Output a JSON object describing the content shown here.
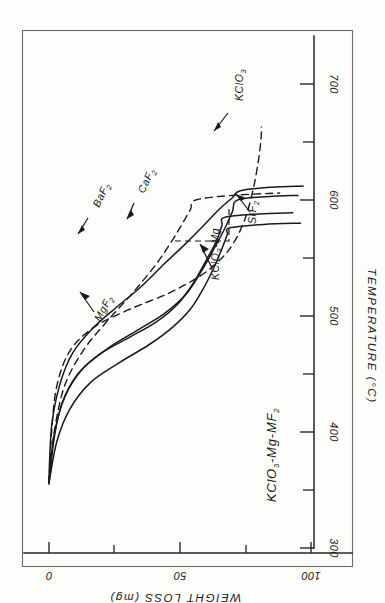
{
  "figure": {
    "title": "KClO3-Mg-MF2",
    "title_parts": {
      "a": "KClO",
      "a_sub": "3",
      "b": "-Mg-MF",
      "b_sub": "2"
    },
    "orientation": "rotated-90",
    "background": "#fdfdfc",
    "ink_color": "#1a1a1a"
  },
  "axes": {
    "temperature": {
      "label": "TEMPERATURE (°C)",
      "unit": "°C",
      "ticks": [
        "300",
        "400",
        "500",
        "600",
        "700"
      ],
      "minor_ticks": [
        "350",
        "450",
        "550",
        "650"
      ],
      "range": [
        270,
        720
      ]
    },
    "weight_loss": {
      "label": "WEIGHT LOSS (mg)",
      "unit": "mg",
      "ticks": [
        "0",
        "50",
        "100"
      ],
      "minor_ticks": [
        "25",
        "75"
      ],
      "range": [
        0,
        108
      ]
    }
  },
  "curve_labels": {
    "kclo3": {
      "a": "KCl",
      "a_sub": "",
      "text": "KClO3"
    },
    "kclo3_mg": {
      "text": "KClO3-Mg"
    },
    "baf2": {
      "text": "BaF2"
    },
    "caf2": {
      "text": "CaF2"
    },
    "srf2": {
      "text": "SrF2"
    },
    "mgf2": {
      "text": "MgF2"
    }
  },
  "chart_data": {
    "type": "line",
    "title": "KClO3-Mg-MF2",
    "xlabel": "TEMPERATURE (°C)",
    "ylabel": "WEIGHT LOSS (mg)",
    "xlim": [
      270,
      720
    ],
    "ylim": [
      0,
      108
    ],
    "xticks": [
      300,
      400,
      500,
      600,
      700
    ],
    "xticks_minor": [
      350,
      450,
      550,
      650
    ],
    "yticks": [
      0,
      50,
      100
    ],
    "yticks_minor": [
      25,
      75
    ],
    "grid": false,
    "legend": "inline-leader-labels",
    "note": "Hand-drawn TGA curves; figure is printed rotated 90 degrees so the temperature axis is vertical at right and the weight-loss axis horizontal at bottom with inverted lettering.",
    "series": [
      {
        "name": "KClO3",
        "style": "dashed",
        "points": [
          [
            355,
            0
          ],
          [
            400,
            1
          ],
          [
            440,
            3
          ],
          [
            470,
            8
          ],
          [
            490,
            17
          ],
          [
            505,
            30
          ],
          [
            520,
            46
          ],
          [
            535,
            58
          ],
          [
            550,
            66
          ],
          [
            565,
            71
          ],
          [
            585,
            75
          ],
          [
            610,
            78
          ],
          [
            635,
            80
          ],
          [
            655,
            81
          ],
          [
            663,
            81
          ]
        ]
      },
      {
        "name": "KClO3-Mg",
        "style": "dashed",
        "points": [
          [
            358,
            0
          ],
          [
            400,
            2
          ],
          [
            440,
            6
          ],
          [
            470,
            13
          ],
          [
            495,
            22
          ],
          [
            520,
            32
          ],
          [
            545,
            41
          ],
          [
            565,
            47
          ],
          [
            580,
            51
          ],
          [
            592,
            54
          ],
          [
            600,
            56
          ],
          [
            604,
            70
          ],
          [
            606,
            88
          ]
        ]
      },
      {
        "name": "BaF2",
        "style": "solid",
        "points": [
          [
            357,
            0
          ],
          [
            395,
            2
          ],
          [
            425,
            5
          ],
          [
            450,
            11
          ],
          [
            468,
            20
          ],
          [
            482,
            31
          ],
          [
            495,
            41
          ],
          [
            510,
            49
          ],
          [
            528,
            55
          ],
          [
            548,
            60
          ],
          [
            565,
            64
          ],
          [
            578,
            66
          ],
          [
            585,
            67
          ],
          [
            588,
            80
          ],
          [
            589,
            93
          ]
        ]
      },
      {
        "name": "CaF2",
        "style": "solid",
        "points": [
          [
            356,
            0
          ],
          [
            398,
            2
          ],
          [
            430,
            6
          ],
          [
            455,
            13
          ],
          [
            473,
            23
          ],
          [
            488,
            34
          ],
          [
            502,
            44
          ],
          [
            518,
            52
          ],
          [
            538,
            58
          ],
          [
            558,
            63
          ],
          [
            575,
            67
          ],
          [
            590,
            70
          ],
          [
            600,
            72
          ],
          [
            603,
            84
          ],
          [
            604,
            95
          ]
        ]
      },
      {
        "name": "SrF2",
        "style": "solid",
        "points": [
          [
            356,
            0
          ],
          [
            392,
            3
          ],
          [
            420,
            8
          ],
          [
            443,
            16
          ],
          [
            460,
            27
          ],
          [
            475,
            38
          ],
          [
            490,
            47
          ],
          [
            506,
            54
          ],
          [
            524,
            59
          ],
          [
            542,
            63
          ],
          [
            558,
            66
          ],
          [
            570,
            68
          ],
          [
            576,
            69
          ],
          [
            579,
            82
          ],
          [
            580,
            96
          ]
        ]
      },
      {
        "name": "MgF2",
        "style": "solid",
        "points": [
          [
            360,
            0
          ],
          [
            405,
            1
          ],
          [
            440,
            4
          ],
          [
            468,
            9
          ],
          [
            490,
            17
          ],
          [
            508,
            26
          ],
          [
            525,
            35
          ],
          [
            545,
            44
          ],
          [
            562,
            52
          ],
          [
            578,
            59
          ],
          [
            592,
            65
          ],
          [
            602,
            70
          ],
          [
            608,
            73
          ],
          [
            611,
            85
          ],
          [
            612,
            97
          ]
        ]
      }
    ]
  }
}
